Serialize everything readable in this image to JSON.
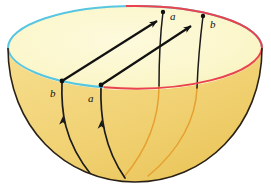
{
  "figure": {
    "kind": "geometry-illustration",
    "canvas": {
      "width": 271,
      "height": 187
    },
    "colors": {
      "background": "#ffffff",
      "inner_surface": "#fbf6c9",
      "outer_surface": "#f2d274",
      "outer_surface_shade": "#ecc65e",
      "rim_front_red": "#e8434f",
      "rim_back_cyan": "#56c6e2",
      "silhouette": "#2a2116",
      "geodesic_black": "#111111",
      "geodesic_orange": "#e5a02f",
      "vector_arrow": "#111111",
      "point_dot": "#111111",
      "label_text": "#111111"
    },
    "geometry": {
      "rim_ellipse": {
        "cx": 135,
        "cy": 48,
        "rx": 127,
        "ry": 42
      },
      "bowl_bottom_y": 182
    }
  },
  "labels": [
    {
      "id": "label-b-near-left",
      "text": "b",
      "x": 50,
      "y": 88,
      "note": "lower-left point on near rim"
    },
    {
      "id": "label-a-near",
      "text": "a",
      "x": 88,
      "y": 93,
      "note": "lower-middle point on near rim"
    },
    {
      "id": "label-a-far",
      "text": "a",
      "x": 170,
      "y": 11,
      "note": "upper point on far rim"
    },
    {
      "id": "label-b-far-right",
      "text": "b",
      "x": 210,
      "y": 19,
      "note": "upper-right point on far rim"
    }
  ],
  "points": [
    {
      "id": "dot-b-near",
      "x": 62,
      "y": 81
    },
    {
      "id": "dot-a-near",
      "x": 101,
      "y": 85
    },
    {
      "id": "dot-a-far",
      "x": 163,
      "y": 12
    },
    {
      "id": "dot-b-far",
      "x": 203,
      "y": 16
    }
  ],
  "vectors": [
    {
      "id": "vector-from-b-near",
      "x1": 62,
      "y1": 81,
      "x2": 158,
      "y2": 20,
      "label": "b"
    },
    {
      "id": "vector-from-a-near",
      "x1": 101,
      "y1": 85,
      "x2": 192,
      "y2": 25,
      "label": "a"
    }
  ],
  "geodesics": {
    "near_black": [
      {
        "id": "geodesic-b-near",
        "d": "M 62 81 C 61 110 63 140 92 176"
      },
      {
        "id": "geodesic-a-near",
        "d": "M 101 85 C 100 116 104 148 125 178"
      }
    ],
    "far_black": [
      {
        "id": "geodesic-a-far",
        "d": "M 163 12 C 160 36 159 60 159 86"
      },
      {
        "id": "geodesic-b-far",
        "d": "M 203 16 C 200 40 198 62 197 88"
      }
    ],
    "hidden_orange": [
      {
        "id": "geodesic-a-far-hidden",
        "d": "M 159 86 C 159 116 150 146 124 177"
      },
      {
        "id": "geodesic-b-far-hidden",
        "d": "M 197 88 C 196 118 180 150 148 176"
      }
    ]
  }
}
